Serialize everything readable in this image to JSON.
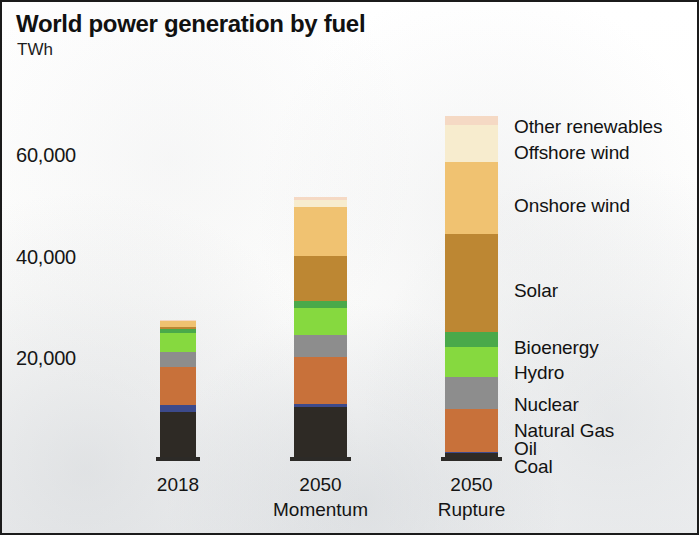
{
  "chart_data": {
    "type": "bar",
    "stacked": true,
    "title": "World power generation by fuel",
    "subtitle": "TWh",
    "xlabel": "",
    "ylabel": "TWh",
    "ylim": [
      0,
      70000
    ],
    "grid": false,
    "legend_position": "right-inline",
    "y_ticks": [
      {
        "label": "20,000",
        "value": 20000
      },
      {
        "label": "40,000",
        "value": 40000
      },
      {
        "label": "60,000",
        "value": 60000
      }
    ],
    "categories": [
      "2018",
      "2050 Momentum",
      "2050 Rupture"
    ],
    "category_labels": [
      {
        "line1": "2018",
        "line2": ""
      },
      {
        "line1": "2050",
        "line2": "Momentum"
      },
      {
        "line1": "2050",
        "line2": "Rupture"
      }
    ],
    "series": [
      {
        "name": "Coal",
        "color": "#2e2a25",
        "values": [
          8900,
          9800,
          700
        ]
      },
      {
        "name": "Oil",
        "color": "#3c4a8c",
        "values": [
          1400,
          600,
          200
        ]
      },
      {
        "name": "Natural Gas",
        "color": "#c8713a",
        "values": [
          7500,
          9300,
          8600
        ]
      },
      {
        "name": "Nuclear",
        "color": "#8d8d8d",
        "values": [
          2900,
          4300,
          6300
        ]
      },
      {
        "name": "Hydro",
        "color": "#86d93f",
        "values": [
          3700,
          5300,
          5900
        ]
      },
      {
        "name": "Bioenergy",
        "color": "#4aa94a",
        "values": [
          800,
          1400,
          3000
        ]
      },
      {
        "name": "Solar",
        "color": "#bd8733",
        "values": [
          500,
          9000,
          19300
        ]
      },
      {
        "name": "Onshore wind",
        "color": "#f0c271",
        "values": [
          1000,
          9500,
          14200
        ]
      },
      {
        "name": "Offshore wind",
        "color": "#f7ecce",
        "values": [
          100,
          1500,
          7300
        ]
      },
      {
        "name": "Other renewables",
        "color": "#f5d9c4",
        "values": [
          200,
          500,
          1600
        ]
      }
    ],
    "totals": [
      27000,
      51200,
      67100
    ],
    "legend_entries": [
      {
        "label": "Other renewables",
        "color": "#f5d9c4"
      },
      {
        "label": "Offshore wind",
        "color": "#f7ecce"
      },
      {
        "label": "Onshore wind",
        "color": "#f0c271"
      },
      {
        "label": "Solar",
        "color": "#bd8733"
      },
      {
        "label": "Bioenergy",
        "color": "#4aa94a"
      },
      {
        "label": "Hydro",
        "color": "#86d93f"
      },
      {
        "label": "Nuclear",
        "color": "#8d8d8d"
      },
      {
        "label": "Natural Gas",
        "color": "#c8713a"
      },
      {
        "label": "Oil",
        "color": "#3c4a8c"
      },
      {
        "label": "Coal",
        "color": "#2e2a25"
      }
    ]
  },
  "layout": {
    "baseline_y": 455,
    "px_per_unit": 0.005075,
    "bars": [
      {
        "x": 158,
        "width": 36
      },
      {
        "x": 292,
        "width": 53
      },
      {
        "x": 443,
        "width": 53
      }
    ],
    "y_tick_pixels": {
      "20000": 358,
      "40000": 257,
      "60000": 155
    },
    "legend_pixels": [
      126,
      152,
      205,
      290,
      347,
      372,
      404,
      430,
      448,
      466
    ],
    "legend_x": 512
  }
}
